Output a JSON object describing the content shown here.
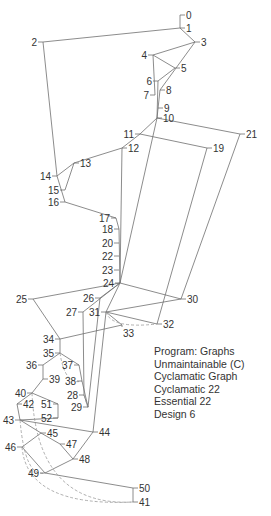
{
  "diagram": {
    "type": "control-flow-graph",
    "nodes": [
      {
        "id": "0",
        "x": 180,
        "y": 15,
        "label_side": "right"
      },
      {
        "id": "1",
        "x": 180,
        "y": 28,
        "label_side": "right"
      },
      {
        "id": "2",
        "x": 43,
        "y": 42,
        "label_side": "left"
      },
      {
        "id": "3",
        "x": 195,
        "y": 42,
        "label_side": "right"
      },
      {
        "id": "4",
        "x": 153,
        "y": 55,
        "label_side": "left"
      },
      {
        "id": "5",
        "x": 175,
        "y": 68,
        "label_side": "right"
      },
      {
        "id": "6",
        "x": 158,
        "y": 81,
        "label_side": "left"
      },
      {
        "id": "7",
        "x": 155,
        "y": 95,
        "label_side": "left"
      },
      {
        "id": "8",
        "x": 160,
        "y": 90,
        "label_side": "right"
      },
      {
        "id": "9",
        "x": 158,
        "y": 108,
        "label_side": "right"
      },
      {
        "id": "10",
        "x": 157,
        "y": 118,
        "label_side": "right"
      },
      {
        "id": "11",
        "x": 140,
        "y": 134,
        "label_side": "left"
      },
      {
        "id": "12",
        "x": 122,
        "y": 148,
        "label_side": "right"
      },
      {
        "id": "13",
        "x": 74,
        "y": 163,
        "label_side": "right"
      },
      {
        "id": "14",
        "x": 57,
        "y": 176,
        "label_side": "left"
      },
      {
        "id": "15",
        "x": 65,
        "y": 190,
        "label_side": "left"
      },
      {
        "id": "16",
        "x": 65,
        "y": 202,
        "label_side": "left"
      },
      {
        "id": "17",
        "x": 116,
        "y": 218,
        "label_side": "left"
      },
      {
        "id": "18",
        "x": 119,
        "y": 229,
        "label_side": "left"
      },
      {
        "id": "19",
        "x": 207,
        "y": 148,
        "label_side": "right"
      },
      {
        "id": "20",
        "x": 119,
        "y": 243,
        "label_side": "left"
      },
      {
        "id": "21",
        "x": 240,
        "y": 134,
        "label_side": "right"
      },
      {
        "id": "22",
        "x": 119,
        "y": 256,
        "label_side": "left"
      },
      {
        "id": "23",
        "x": 119,
        "y": 270,
        "label_side": "left"
      },
      {
        "id": "24",
        "x": 120,
        "y": 283,
        "label_side": "left"
      },
      {
        "id": "25",
        "x": 33,
        "y": 299,
        "label_side": "left"
      },
      {
        "id": "26",
        "x": 100,
        "y": 298,
        "label_side": "left"
      },
      {
        "id": "27",
        "x": 83,
        "y": 312,
        "label_side": "left"
      },
      {
        "id": "28",
        "x": 84,
        "y": 395,
        "label_side": "left"
      },
      {
        "id": "29",
        "x": 88,
        "y": 407,
        "label_side": "left"
      },
      {
        "id": "30",
        "x": 181,
        "y": 299,
        "label_side": "right"
      },
      {
        "id": "31",
        "x": 106,
        "y": 312,
        "label_side": "left"
      },
      {
        "id": "32",
        "x": 157,
        "y": 324,
        "label_side": "right"
      },
      {
        "id": "33",
        "x": 122,
        "y": 325,
        "label_side": "below"
      },
      {
        "id": "34",
        "x": 60,
        "y": 339,
        "label_side": "left"
      },
      {
        "id": "35",
        "x": 60,
        "y": 353,
        "label_side": "left"
      },
      {
        "id": "36",
        "x": 43,
        "y": 365,
        "label_side": "left"
      },
      {
        "id": "37",
        "x": 79,
        "y": 365,
        "label_side": "left"
      },
      {
        "id": "38",
        "x": 82,
        "y": 381,
        "label_side": "left"
      },
      {
        "id": "39",
        "x": 43,
        "y": 379,
        "label_side": "right"
      },
      {
        "id": "40",
        "x": 32,
        "y": 393,
        "label_side": "left"
      },
      {
        "id": "41",
        "x": 133,
        "y": 502,
        "label_side": "right"
      },
      {
        "id": "42",
        "x": 17,
        "y": 404,
        "label_side": "right"
      },
      {
        "id": "43",
        "x": 20,
        "y": 420,
        "label_side": "left"
      },
      {
        "id": "44",
        "x": 93,
        "y": 432,
        "label_side": "right"
      },
      {
        "id": "45",
        "x": 41,
        "y": 433,
        "label_side": "right"
      },
      {
        "id": "46",
        "x": 22,
        "y": 447,
        "label_side": "left"
      },
      {
        "id": "47",
        "x": 60,
        "y": 444,
        "label_side": "right"
      },
      {
        "id": "48",
        "x": 73,
        "y": 459,
        "label_side": "right"
      },
      {
        "id": "49",
        "x": 45,
        "y": 473,
        "label_side": "left"
      },
      {
        "id": "50",
        "x": 133,
        "y": 488,
        "label_side": "right"
      },
      {
        "id": "51",
        "x": 58,
        "y": 404,
        "label_side": "left"
      },
      {
        "id": "52",
        "x": 58,
        "y": 418,
        "label_side": "left"
      }
    ],
    "edges": [
      [
        "0",
        "1"
      ],
      [
        "1",
        "2"
      ],
      [
        "1",
        "3"
      ],
      [
        "2",
        "14"
      ],
      [
        "3",
        "4"
      ],
      [
        "3",
        "8"
      ],
      [
        "4",
        "5"
      ],
      [
        "4",
        "7"
      ],
      [
        "5",
        "6"
      ],
      [
        "6",
        "10"
      ],
      [
        "8",
        "10"
      ],
      [
        "10",
        "11"
      ],
      [
        "10",
        "21"
      ],
      [
        "10",
        "24"
      ],
      [
        "11",
        "12"
      ],
      [
        "11",
        "19"
      ],
      [
        "12",
        "13"
      ],
      [
        "12",
        "24"
      ],
      [
        "13",
        "14"
      ],
      [
        "13",
        "15"
      ],
      [
        "14",
        "16"
      ],
      [
        "16",
        "17"
      ],
      [
        "17",
        "18"
      ],
      [
        "18",
        "24"
      ],
      [
        "19",
        "32"
      ],
      [
        "21",
        "30"
      ],
      [
        "24",
        "25"
      ],
      [
        "24",
        "26"
      ],
      [
        "24",
        "27"
      ],
      [
        "24",
        "30"
      ],
      [
        "24",
        "31"
      ],
      [
        "25",
        "34"
      ],
      [
        "26",
        "29"
      ],
      [
        "27",
        "28"
      ],
      [
        "28",
        "29"
      ],
      [
        "30",
        "31"
      ],
      [
        "31",
        "32"
      ],
      [
        "31",
        "33"
      ],
      [
        "33",
        "34"
      ],
      [
        "34",
        "35"
      ],
      [
        "35",
        "36"
      ],
      [
        "35",
        "37"
      ],
      [
        "36",
        "39"
      ],
      [
        "37",
        "38"
      ],
      [
        "38",
        "29"
      ],
      [
        "39",
        "40"
      ],
      [
        "40",
        "42"
      ],
      [
        "40",
        "51"
      ],
      [
        "51",
        "52"
      ],
      [
        "52",
        "43"
      ],
      [
        "42",
        "43"
      ],
      [
        "43",
        "44"
      ],
      [
        "43",
        "45"
      ],
      [
        "44",
        "48"
      ],
      [
        "45",
        "46"
      ],
      [
        "45",
        "47"
      ],
      [
        "46",
        "49"
      ],
      [
        "47",
        "48"
      ],
      [
        "48",
        "49"
      ],
      [
        "49",
        "50"
      ],
      [
        "50",
        "41"
      ],
      [
        "31",
        "44"
      ]
    ],
    "dashed_edges": [
      [
        "31",
        "32"
      ],
      [
        "35",
        "38"
      ],
      [
        "28",
        "29"
      ],
      [
        "40",
        "41"
      ],
      [
        "43",
        "49"
      ],
      [
        "46",
        "41"
      ]
    ]
  },
  "legend": {
    "lines": [
      "Program: Graphs",
      "Unmaintainable (C)",
      "Cyclamatic Graph",
      "Cyclamatic 22",
      "Essential 22",
      "Design 6"
    ]
  }
}
